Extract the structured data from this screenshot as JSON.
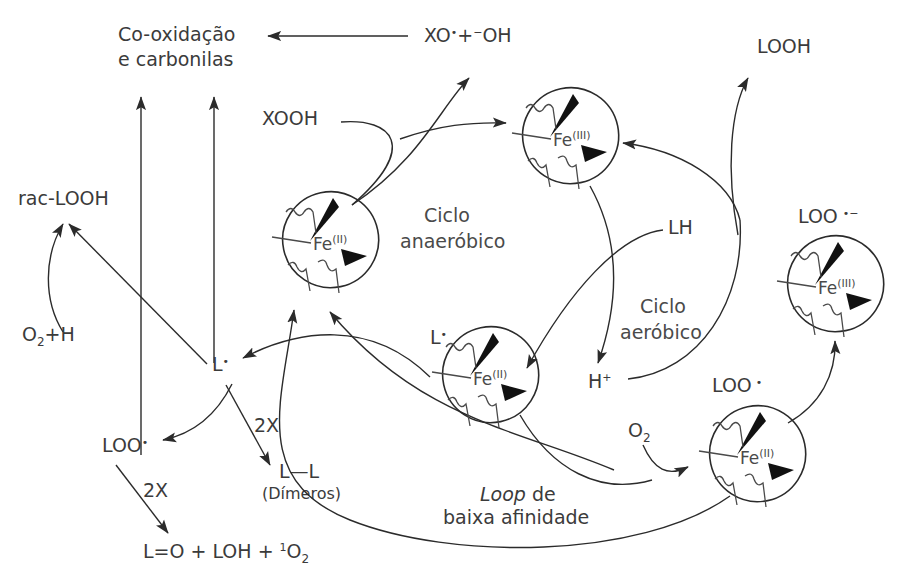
{
  "figure": {
    "kind": "reaction-scheme",
    "background": "#ffffff",
    "ink": "#2b2b2b",
    "text_color": "#3b3b3b"
  },
  "labels": {
    "co_oxidacao_l1": "Co-oxidação",
    "co_oxidacao_l2": "e carbonilas",
    "xo_radical": "XO",
    "xo_radical_dot": "•",
    "xo_plus": "+",
    "oh_minus_sup": "−",
    "oh_minus": "OH",
    "xooh": "XOOH",
    "rac_loooh": "rac-LOOH",
    "o2_plus_h": "O",
    "o2_plus_h_sub": "2",
    "o2_plus_h_tail": "+H",
    "l_radical": "L",
    "l_radical_dot": "•",
    "loo_radical": "LOO",
    "loo_radical_dot": "•",
    "two_x_a": "2X",
    "two_x_b": "2X",
    "l_l": "L—L",
    "dimeros": "(Dímeros)",
    "bottom_products": "L=O + LOH + ",
    "bottom_products_sup": "1",
    "bottom_products_tail": "O",
    "bottom_products_sub": "2",
    "ciclo_anaerobico_l1": "Ciclo",
    "ciclo_anaerobico_l2": "anaeróbico",
    "ciclo_aerobico_l1": "Ciclo",
    "ciclo_aerobico_l2": "aeróbico",
    "lh": "LH",
    "h_plus": "H",
    "h_plus_sup": "+",
    "looh": "LOOH",
    "loo_anion": "LOO",
    "loo_anion_dot": "•",
    "loo_anion_sup": "−",
    "loo_radical_right": "LOO",
    "loo_radical_right_dot": "•",
    "o2_right": "O",
    "o2_right_sub": "2",
    "loop_word": "Loop",
    "loop_tail": " de",
    "loop_line2": "baixa afinidade",
    "l_radical_small": "L",
    "l_radical_small_dot": "•"
  },
  "heme_centers": [
    {
      "id": "fe2-left",
      "element": "Fe",
      "oxidation": "(II)",
      "cx": 315,
      "cy": 243
    },
    {
      "id": "fe3-top",
      "element": "Fe",
      "oxidation": "(III)",
      "cx": 555,
      "cy": 139
    },
    {
      "id": "fe2-center",
      "element": "Fe",
      "oxidation": "(II)",
      "cx": 475,
      "cy": 378
    },
    {
      "id": "fe3-right",
      "element": "Fe",
      "oxidation": "(III)",
      "cx": 820,
      "cy": 287
    },
    {
      "id": "fe2-lowright",
      "element": "Fe",
      "oxidation": "(II)",
      "cx": 742,
      "cy": 457
    }
  ],
  "cycles": [
    {
      "name": "Ciclo anaeróbico",
      "x": 470,
      "y": 222
    },
    {
      "name": "Ciclo aeróbico",
      "x": 660,
      "y": 322
    }
  ],
  "species": [
    "Co-oxidação e carbonilas",
    "XO• + ⁻OH",
    "XOOH",
    "rac-LOOH",
    "O₂+H",
    "L•",
    "LOO•",
    "L—L (Dímeros)",
    "L=O + LOH + ¹O₂",
    "LH",
    "H⁺",
    "LOOH",
    "LOO•⁻",
    "O₂",
    "2X"
  ]
}
